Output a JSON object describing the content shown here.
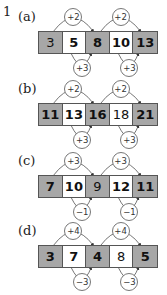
{
  "question_number": "1",
  "colors": {
    "shaded_cell": "#a7a7a7",
    "plain_cell": "#ffffff",
    "border": "#555555"
  },
  "parts": [
    {
      "label": "(a)",
      "cells": [
        {
          "value": "3",
          "shaded": true,
          "bold": false
        },
        {
          "value": "5",
          "shaded": false,
          "bold": true
        },
        {
          "value": "8",
          "shaded": true,
          "bold": true
        },
        {
          "value": "10",
          "shaded": false,
          "bold": true
        },
        {
          "value": "13",
          "shaded": true,
          "bold": true
        }
      ],
      "top_steps": [
        "+2",
        "+2"
      ],
      "bottom_steps": [
        "+3",
        "+3"
      ]
    },
    {
      "label": "(b)",
      "cells": [
        {
          "value": "11",
          "shaded": true,
          "bold": true
        },
        {
          "value": "13",
          "shaded": false,
          "bold": true
        },
        {
          "value": "16",
          "shaded": true,
          "bold": true
        },
        {
          "value": "18",
          "shaded": false,
          "bold": false
        },
        {
          "value": "21",
          "shaded": true,
          "bold": true
        }
      ],
      "top_steps": [
        "+2",
        "+2"
      ],
      "bottom_steps": [
        "+3",
        "+3"
      ]
    },
    {
      "label": "(c)",
      "cells": [
        {
          "value": "7",
          "shaded": true,
          "bold": true
        },
        {
          "value": "10",
          "shaded": false,
          "bold": true
        },
        {
          "value": "9",
          "shaded": true,
          "bold": false
        },
        {
          "value": "12",
          "shaded": false,
          "bold": true
        },
        {
          "value": "11",
          "shaded": true,
          "bold": true
        }
      ],
      "top_steps": [
        "+3",
        "+3"
      ],
      "bottom_steps": [
        "−1",
        "−1"
      ]
    },
    {
      "label": "(d)",
      "cells": [
        {
          "value": "3",
          "shaded": true,
          "bold": true
        },
        {
          "value": "7",
          "shaded": false,
          "bold": true
        },
        {
          "value": "4",
          "shaded": true,
          "bold": true
        },
        {
          "value": "8",
          "shaded": false,
          "bold": false
        },
        {
          "value": "5",
          "shaded": true,
          "bold": true
        }
      ],
      "top_steps": [
        "+4",
        "+4"
      ],
      "bottom_steps": [
        "−3",
        "−3"
      ]
    }
  ]
}
